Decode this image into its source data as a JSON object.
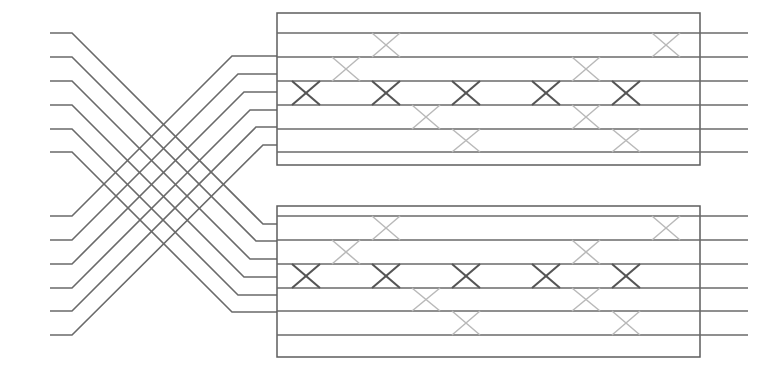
{
  "figure": {
    "kind": "permutation-network",
    "title": "",
    "width": 757,
    "height": 376,
    "background": "#ffffff",
    "line_color": "#6a6a6a",
    "line_color_faint": "#b9b9b9",
    "line_color_bold": "#555555",
    "box_border_color": "#5d5d5d",
    "line_width": 1.6
  },
  "chart_data": {
    "type": "diagram",
    "title": "",
    "xlabel": "",
    "ylabel": "",
    "input_count": 12,
    "output_count": 12,
    "stage_count": 2,
    "switches_per_stage": 15,
    "input_terminal_x": 50,
    "input_stub_end_x": 72,
    "output_terminal_x": 748,
    "input_y": [
      33,
      57,
      81,
      105,
      129,
      152,
      216,
      240,
      264,
      288,
      311,
      335
    ],
    "output_y": [
      33,
      57,
      81,
      105,
      129,
      152,
      216,
      240,
      264,
      288,
      311,
      335
    ],
    "shuffle": {
      "fan_start_x": 72,
      "fan_end_x": 258,
      "note": "top six inputs descend to lower block, bottom six ascend to upper block"
    },
    "boxes": [
      {
        "name": "upper-stage-box",
        "x": 277,
        "y": 13,
        "width": 423,
        "height": 152,
        "wire_y": [
          33,
          57,
          81,
          105,
          129,
          152
        ],
        "crossing_x": [
          310,
          390,
          470,
          550,
          630
        ],
        "crossing_half_width": 27
      },
      {
        "name": "lower-stage-box",
        "x": 277,
        "y": 206,
        "width": 423,
        "height": 151,
        "wire_y": [
          216,
          240,
          264,
          288,
          311,
          335
        ],
        "crossing_x": [
          310,
          390,
          470,
          550,
          630
        ],
        "crossing_half_width": 27
      }
    ],
    "legend": [],
    "annotations": []
  },
  "labels": {
    "input_ports": [
      "in-1",
      "in-2",
      "in-3",
      "in-4",
      "in-5",
      "in-6",
      "in-7",
      "in-8",
      "in-9",
      "in-10",
      "in-11",
      "in-12"
    ],
    "output_ports": [
      "out-1",
      "out-2",
      "out-3",
      "out-4",
      "out-5",
      "out-6",
      "out-7",
      "out-8",
      "out-9",
      "out-10",
      "out-11",
      "out-12"
    ]
  }
}
